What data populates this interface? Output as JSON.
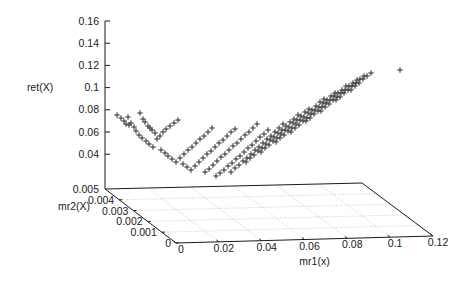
{
  "figure": {
    "kind": "gnuplot-3d-scatter",
    "width": 475,
    "height": 286,
    "background": "#ffffff",
    "ink": "#1a1a1a",
    "grid_color": "#b4b4b4",
    "marker": "plus",
    "marker_color": "#3a3a3a"
  },
  "axes": {
    "z": {
      "label": "ret(X)",
      "ticks": [
        "0.16",
        "0.14",
        "0.12",
        "0.1",
        "0.08",
        "0.06",
        "0.04"
      ],
      "base_tick": "0.005"
    },
    "y": {
      "label": "mr2(X)",
      "ticks": [
        "0.005",
        "0.004",
        "0.003",
        "0.002",
        "0.001",
        "0"
      ]
    },
    "x": {
      "label": "mr1(x)",
      "ticks": [
        "0",
        "0.02",
        "0.04",
        "0.06",
        "0.08",
        "0.1",
        "0.12"
      ]
    }
  },
  "chart_data": {
    "type": "scatter",
    "title": "",
    "xlabel": "mr1(x)",
    "ylabel": "mr2(X)",
    "zlabel": "ret(X)",
    "xlim": [
      0,
      0.12
    ],
    "ylim": [
      0,
      0.005
    ],
    "zlim": [
      0.005,
      0.16
    ],
    "xticks": [
      0,
      0.02,
      0.04,
      0.06,
      0.08,
      0.1,
      0.12
    ],
    "yticks": [
      0,
      0.001,
      0.002,
      0.003,
      0.004,
      0.005
    ],
    "zticks": [
      0.04,
      0.06,
      0.08,
      0.1,
      0.12,
      0.14,
      0.16
    ],
    "grid": true,
    "legend": false,
    "projection": "gnuplot-default",
    "marker": "+",
    "note": "Valley/V-shaped surface of sample points plus one isolated high outlier at far right.",
    "points_px": [
      [
        117,
        115
      ],
      [
        121,
        118
      ],
      [
        124,
        121
      ],
      [
        128,
        117
      ],
      [
        131,
        123
      ],
      [
        134,
        127
      ],
      [
        129,
        125
      ],
      [
        126,
        124
      ],
      [
        140,
        113
      ],
      [
        145,
        122
      ],
      [
        148,
        126
      ],
      [
        152,
        130
      ],
      [
        155,
        133
      ],
      [
        150,
        128
      ],
      [
        143,
        119
      ],
      [
        136,
        131
      ],
      [
        139,
        135
      ],
      [
        142,
        138
      ],
      [
        146,
        141
      ],
      [
        149,
        144
      ],
      [
        153,
        147
      ],
      [
        157,
        139
      ],
      [
        160,
        136
      ],
      [
        163,
        132
      ],
      [
        166,
        129
      ],
      [
        170,
        126
      ],
      [
        174,
        123
      ],
      [
        178,
        120
      ],
      [
        161,
        150
      ],
      [
        165,
        153
      ],
      [
        168,
        156
      ],
      [
        172,
        159
      ],
      [
        176,
        162
      ],
      [
        180,
        158
      ],
      [
        184,
        154
      ],
      [
        188,
        150
      ],
      [
        192,
        147
      ],
      [
        196,
        143
      ],
      [
        200,
        139
      ],
      [
        204,
        136
      ],
      [
        208,
        132
      ],
      [
        212,
        128
      ],
      [
        183,
        164
      ],
      [
        187,
        167
      ],
      [
        191,
        170
      ],
      [
        195,
        166
      ],
      [
        199,
        162
      ],
      [
        203,
        158
      ],
      [
        207,
        154
      ],
      [
        211,
        151
      ],
      [
        215,
        147
      ],
      [
        219,
        143
      ],
      [
        223,
        140
      ],
      [
        227,
        136
      ],
      [
        231,
        132
      ],
      [
        235,
        129
      ],
      [
        205,
        172
      ],
      [
        209,
        169
      ],
      [
        213,
        165
      ],
      [
        217,
        161
      ],
      [
        221,
        157
      ],
      [
        225,
        154
      ],
      [
        229,
        150
      ],
      [
        233,
        146
      ],
      [
        237,
        143
      ],
      [
        241,
        139
      ],
      [
        245,
        135
      ],
      [
        249,
        132
      ],
      [
        253,
        128
      ],
      [
        257,
        124
      ],
      [
        216,
        176
      ],
      [
        220,
        173
      ],
      [
        224,
        170
      ],
      [
        228,
        166
      ],
      [
        232,
        163
      ],
      [
        236,
        159
      ],
      [
        240,
        156
      ],
      [
        244,
        152
      ],
      [
        248,
        148
      ],
      [
        252,
        145
      ],
      [
        256,
        141
      ],
      [
        260,
        137
      ],
      [
        264,
        134
      ],
      [
        268,
        130
      ],
      [
        231,
        172
      ],
      [
        235,
        168
      ],
      [
        239,
        165
      ],
      [
        243,
        161
      ],
      [
        247,
        158
      ],
      [
        251,
        154
      ],
      [
        255,
        150
      ],
      [
        259,
        147
      ],
      [
        263,
        143
      ],
      [
        267,
        139
      ],
      [
        271,
        136
      ],
      [
        275,
        132
      ],
      [
        279,
        128
      ],
      [
        283,
        124
      ],
      [
        246,
        162
      ],
      [
        250,
        158
      ],
      [
        254,
        155
      ],
      [
        258,
        151
      ],
      [
        262,
        148
      ],
      [
        266,
        144
      ],
      [
        270,
        140
      ],
      [
        274,
        137
      ],
      [
        278,
        133
      ],
      [
        282,
        130
      ],
      [
        286,
        126
      ],
      [
        290,
        122
      ],
      [
        294,
        119
      ],
      [
        298,
        115
      ],
      [
        261,
        152
      ],
      [
        265,
        148
      ],
      [
        269,
        145
      ],
      [
        273,
        141
      ],
      [
        277,
        138
      ],
      [
        281,
        134
      ],
      [
        285,
        130
      ],
      [
        289,
        127
      ],
      [
        293,
        123
      ],
      [
        297,
        120
      ],
      [
        301,
        116
      ],
      [
        305,
        112
      ],
      [
        309,
        109
      ],
      [
        276,
        142
      ],
      [
        280,
        138
      ],
      [
        284,
        135
      ],
      [
        288,
        131
      ],
      [
        292,
        128
      ],
      [
        296,
        124
      ],
      [
        300,
        120
      ],
      [
        304,
        117
      ],
      [
        308,
        113
      ],
      [
        312,
        110
      ],
      [
        316,
        106
      ],
      [
        320,
        102
      ],
      [
        324,
        99
      ],
      [
        291,
        132
      ],
      [
        295,
        128
      ],
      [
        299,
        125
      ],
      [
        303,
        121
      ],
      [
        307,
        118
      ],
      [
        311,
        114
      ],
      [
        315,
        110
      ],
      [
        319,
        107
      ],
      [
        323,
        103
      ],
      [
        327,
        100
      ],
      [
        331,
        96
      ],
      [
        335,
        93
      ],
      [
        306,
        121
      ],
      [
        310,
        118
      ],
      [
        314,
        114
      ],
      [
        318,
        111
      ],
      [
        322,
        107
      ],
      [
        326,
        103
      ],
      [
        330,
        100
      ],
      [
        334,
        96
      ],
      [
        338,
        93
      ],
      [
        342,
        90
      ],
      [
        346,
        86
      ],
      [
        321,
        111
      ],
      [
        325,
        107
      ],
      [
        329,
        104
      ],
      [
        333,
        100
      ],
      [
        337,
        97
      ],
      [
        341,
        93
      ],
      [
        345,
        90
      ],
      [
        349,
        86
      ],
      [
        353,
        83
      ],
      [
        357,
        80
      ],
      [
        336,
        100
      ],
      [
        340,
        97
      ],
      [
        344,
        93
      ],
      [
        348,
        90
      ],
      [
        352,
        86
      ],
      [
        356,
        83
      ],
      [
        360,
        79
      ],
      [
        364,
        76
      ],
      [
        351,
        90
      ],
      [
        355,
        86
      ],
      [
        359,
        83
      ],
      [
        363,
        79
      ],
      [
        367,
        76
      ],
      [
        371,
        73
      ],
      [
        400,
        70
      ]
    ]
  },
  "geometry": {
    "base_plane": {
      "back_left": [
        105,
        189
      ],
      "front_left": [
        176,
        243
      ],
      "front_right": [
        433,
        236
      ],
      "back_right": [
        362,
        183
      ]
    },
    "z_axis_top": [
      105,
      21
    ],
    "z_axis_bottom": [
      105,
      189
    ]
  }
}
